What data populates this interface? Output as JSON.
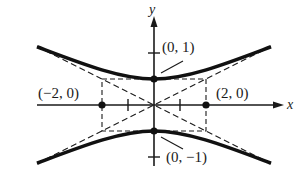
{
  "diagram": {
    "axes": {
      "x_label": "x",
      "y_label": "y"
    },
    "points": [
      {
        "label": "(0,  1)",
        "x": 0,
        "y": 1
      },
      {
        "label": "(0,  −1)",
        "x": 0,
        "y": -1
      },
      {
        "label": "(−2,  0)",
        "x": -2,
        "y": 0
      },
      {
        "label": "(2,  0)",
        "x": 2,
        "y": 0
      }
    ],
    "asymptotes": [
      "y = x/2",
      "y = -x/2"
    ],
    "rectangle": {
      "x_min": -2,
      "x_max": 2,
      "y_min": -1,
      "y_max": 1
    },
    "colors": {
      "ink": "#1a1a1a",
      "background": "#ffffff"
    }
  }
}
